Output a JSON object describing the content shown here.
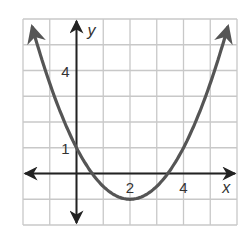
{
  "chart_data": {
    "type": "line",
    "title": "",
    "xlabel": "x",
    "ylabel": "y",
    "xlim": [
      -2,
      6
    ],
    "ylim": [
      -2,
      6
    ],
    "grid": true,
    "x_tick_labels": [
      {
        "value": 2,
        "label": "2"
      },
      {
        "value": 4,
        "label": "4"
      }
    ],
    "y_tick_labels": [
      {
        "value": 1,
        "label": "1"
      },
      {
        "value": 4,
        "label": "4"
      }
    ],
    "series": [
      {
        "name": "parabola",
        "equation": "y = 0.5(x - 2)^2 - 1",
        "vertex": [
          2,
          -1
        ],
        "y_intercept": 1,
        "x_intercepts": [
          0.59,
          3.41
        ],
        "x": [
          -1.65,
          -1,
          0,
          1,
          2,
          3,
          4,
          5,
          5.65
        ],
        "values": [
          5.66,
          3.5,
          1,
          -0.5,
          -1,
          -0.5,
          1,
          3.5,
          5.66
        ],
        "arrows_at_ends": true
      }
    ]
  },
  "colors": {
    "grid": "#c8c8c8",
    "axis": "#222222",
    "curve": "#555555",
    "text": "#333333"
  }
}
